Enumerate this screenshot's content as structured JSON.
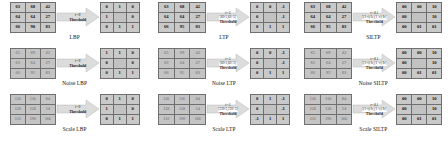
{
  "figure": {
    "arrow_color": "#d8d8d8",
    "grid_border_color": "#6f6f6f",
    "cell_color": "#c9c9c9"
  },
  "columns": [
    {
      "id": "lbp",
      "blocks": [
        {
          "caption": "LBP",
          "input": {
            "type": "matrix",
            "rows": [
              [
                "63",
                "68",
                "42"
              ],
              [
                "64",
                "64",
                "27"
              ],
              [
                "66",
                "90",
                "83"
              ]
            ],
            "faded": false
          },
          "annotation": {
            "tau": "t=0",
            "interval": "",
            "threshold": "Threshold"
          },
          "output": {
            "type": "matrix",
            "rows": [
              [
                "0",
                "1",
                "0"
              ],
              [
                "1",
                "",
                "0"
              ],
              [
                "0",
                "1",
                "1"
              ]
            ],
            "center_blank": true
          }
        },
        {
          "caption": "Noise LBP",
          "input": {
            "type": "matrix",
            "rows": [
              [
                "65",
                "69",
                "42"
              ],
              [
                "63",
                "64",
                "27"
              ],
              [
                "66",
                "95",
                "83"
              ]
            ],
            "faded": true
          },
          "annotation": {
            "tau": "t=0",
            "interval": "",
            "threshold": "Threshold"
          },
          "output": {
            "type": "matrix",
            "rows": [
              [
                "1",
                "1",
                "0"
              ],
              [
                "0",
                "",
                "0"
              ],
              [
                "0",
                "1",
                "1"
              ]
            ],
            "center_blank": true
          }
        },
        {
          "caption": "Scale LBP",
          "input": {
            "type": "matrix",
            "rows": [
              [
                "126",
                "136",
                "84"
              ],
              [
                "128",
                "128",
                "54"
              ],
              [
                "132",
                "190",
                "166"
              ]
            ],
            "faded": true
          },
          "annotation": {
            "tau": "t=0",
            "interval": "",
            "threshold": "Threshold"
          },
          "output": {
            "type": "matrix",
            "rows": [
              [
                "0",
                "1",
                "0"
              ],
              [
                "1",
                "",
                "0"
              ],
              [
                "0",
                "1",
                "1"
              ]
            ],
            "center_blank": true
          }
        }
      ]
    },
    {
      "id": "ltp",
      "blocks": [
        {
          "caption": "LTP",
          "input": {
            "type": "matrix",
            "rows": [
              [
                "63",
                "68",
                "42"
              ],
              [
                "64",
                "64",
                "27"
              ],
              [
                "66",
                "95",
                "83"
              ]
            ],
            "faded": false
          },
          "annotation": {
            "tau": "t=5",
            "interval": "[60-5,60+5]",
            "threshold": "Threshold"
          },
          "output": {
            "type": "matrix",
            "rows": [
              [
                "0",
                "0",
                "-1"
              ],
              [
                "0",
                "",
                "-1"
              ],
              [
                "0",
                "1",
                "1"
              ]
            ],
            "center_blank": true
          }
        },
        {
          "caption": "Noise LTP",
          "input": {
            "type": "matrix",
            "rows": [
              [
                "65",
                "69",
                "42"
              ],
              [
                "63",
                "64",
                "27"
              ],
              [
                "66",
                "95",
                "83"
              ]
            ],
            "faded": true
          },
          "annotation": {
            "tau": "t=5",
            "interval": "[60-5,60+5]",
            "threshold": "Threshold"
          },
          "output": {
            "type": "matrix",
            "rows": [
              [
                "0",
                "0",
                "-1"
              ],
              [
                "0",
                "",
                "-1"
              ],
              [
                "0",
                "1",
                "1"
              ]
            ],
            "center_blank": true
          }
        },
        {
          "caption": "Scale LTP",
          "input": {
            "type": "matrix",
            "rows": [
              [
                "126",
                "136",
                "84"
              ],
              [
                "128",
                "128",
                "54"
              ],
              [
                "132",
                "190",
                "166"
              ]
            ],
            "faded": true
          },
          "annotation": {
            "tau": "t=5",
            "interval": "[120-5,120+5]",
            "threshold": "Threshold"
          },
          "output": {
            "type": "matrix",
            "rows": [
              [
                "0",
                "1",
                "-1"
              ],
              [
                "0",
                "",
                "-1"
              ],
              [
                "-1",
                "1",
                "1"
              ]
            ],
            "center_blank": true
          }
        }
      ]
    },
    {
      "id": "siltp",
      "blocks": [
        {
          "caption": "SILTP",
          "input": {
            "type": "matrix",
            "rows": [
              [
                "63",
                "68",
                "42"
              ],
              [
                "64",
                "64",
                "27"
              ],
              [
                "66",
                "95",
                "83"
              ]
            ],
            "faded": false
          },
          "annotation": {
            "tau": "τ=0.1",
            "interval": "[(1-τ)·Ic,(1+τ)·Ic]",
            "threshold": "Threshold"
          },
          "output": {
            "type": "matrix",
            "rows": [
              [
                "00",
                "00",
                "10"
              ],
              [
                "00",
                "",
                "10"
              ],
              [
                "00",
                "01",
                "01"
              ]
            ],
            "center_blank": true
          }
        },
        {
          "caption": "Noise SILTP",
          "input": {
            "type": "matrix",
            "rows": [
              [
                "65",
                "69",
                "42"
              ],
              [
                "63",
                "64",
                "27"
              ],
              [
                "66",
                "95",
                "83"
              ]
            ],
            "faded": true
          },
          "annotation": {
            "tau": "τ=0.1",
            "interval": "[(1-τ)·Ic,(1+τ)·Ic]",
            "threshold": "Threshold"
          },
          "output": {
            "type": "matrix",
            "rows": [
              [
                "00",
                "00",
                "10"
              ],
              [
                "00",
                "",
                "10"
              ],
              [
                "00",
                "01",
                "01"
              ]
            ],
            "center_blank": true
          }
        },
        {
          "caption": "Scale SILTP",
          "input": {
            "type": "matrix",
            "rows": [
              [
                "126",
                "136",
                "84"
              ],
              [
                "128",
                "128",
                "54"
              ],
              [
                "132",
                "190",
                "166"
              ]
            ],
            "faded": true
          },
          "annotation": {
            "tau": "τ=0.1",
            "interval": "[(1-τ)·Ic,(1+τ)·Ic]",
            "threshold": "Threshold"
          },
          "output": {
            "type": "matrix",
            "rows": [
              [
                "00",
                "00",
                "10"
              ],
              [
                "00",
                "",
                "10"
              ],
              [
                "00",
                "01",
                "01"
              ]
            ],
            "center_blank": true
          }
        }
      ]
    }
  ]
}
